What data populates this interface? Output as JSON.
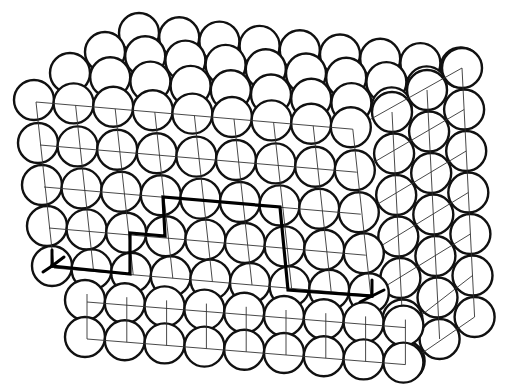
{
  "diagram": {
    "type": "crystal-lattice-circle-packing",
    "colors": {
      "background": "#ffffff",
      "atom_stroke": "#111111",
      "grid": "#333333",
      "circuit": "#000000"
    },
    "atom_radius": 20,
    "front_face_rows": [
      {
        "x0": 34,
        "y0": 100,
        "count": 9,
        "dx": 39.6,
        "dy": 3.4
      },
      {
        "x0": 38,
        "y0": 143,
        "count": 9,
        "dx": 39.6,
        "dy": 3.4
      },
      {
        "x0": 42,
        "y0": 185,
        "count": 9,
        "dx": 39.6,
        "dy": 3.4
      },
      {
        "x0": 47,
        "y0": 226,
        "count": 9,
        "dx": 39.6,
        "dy": 3.4
      },
      {
        "x0": 52,
        "y0": 266,
        "count": 9,
        "dx": 39.6,
        "dy": 3.4
      },
      {
        "x0": 85,
        "y0": 300,
        "count": 9,
        "dx": 39.8,
        "dy": 3.2
      },
      {
        "x0": 85,
        "y0": 337,
        "count": 9,
        "dx": 39.8,
        "dy": 3.2
      }
    ],
    "top_face_rows": [
      {
        "x0": 139,
        "y0": 33,
        "count": 9,
        "dx": 40.2,
        "dy": 4.3
      },
      {
        "x0": 105,
        "y0": 52,
        "count": 9,
        "dx": 40.2,
        "dy": 4.3
      },
      {
        "x0": 70,
        "y0": 73,
        "count": 9,
        "dx": 40.2,
        "dy": 4.3
      }
    ],
    "side_face_columns": [
      {
        "x0": 462,
        "y0": 68,
        "count": 7,
        "dx": 2.1,
        "dy": 41.5
      },
      {
        "x0": 427,
        "y0": 90,
        "count": 7,
        "dx": 2.1,
        "dy": 41.5
      },
      {
        "x0": 392,
        "y0": 112,
        "count": 7,
        "dx": 2.1,
        "dy": 41.5
      }
    ],
    "circuit_path": [
      [
        52,
        266
      ],
      [
        130,
        274
      ],
      [
        130,
        233
      ],
      [
        165,
        236
      ],
      [
        163,
        197
      ],
      [
        280,
        207
      ],
      [
        288,
        290
      ],
      [
        372,
        296
      ]
    ],
    "start_symbol": {
      "x": 52,
      "y": 266
    },
    "end_symbol": {
      "x": 372,
      "y": 296
    }
  }
}
